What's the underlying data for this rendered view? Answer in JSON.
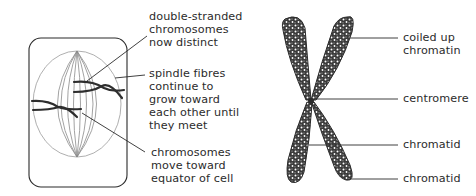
{
  "figure": {
    "left_panel": {
      "name": "cell-in-metaphase",
      "labels": [
        {
          "id": "double-stranded",
          "lines": [
            "double-stranded",
            "chromosomes",
            "now distinct"
          ]
        },
        {
          "id": "spindle-fibres",
          "lines": [
            "spindle fibres",
            "continue to",
            "grow toward",
            "each other until",
            "they meet"
          ]
        },
        {
          "id": "chromosomes-move",
          "lines": [
            "chromosomes",
            "move toward",
            "equator of cell"
          ]
        }
      ]
    },
    "right_panel": {
      "name": "chromosome-structure",
      "labels": [
        {
          "id": "coiled-up-chromatin",
          "lines": [
            "coiled up",
            "chromatin"
          ]
        },
        {
          "id": "centromere",
          "lines": [
            "centromere"
          ]
        },
        {
          "id": "chromatid-1",
          "lines": [
            "chromatid"
          ]
        },
        {
          "id": "chromatid-2",
          "lines": [
            "chromatid"
          ]
        }
      ]
    },
    "colors": {
      "ink": "#2b2b2b",
      "spindle": "#8a8a8a",
      "background": "#ffffff"
    }
  }
}
